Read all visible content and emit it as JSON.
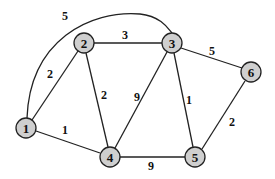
{
  "graph": {
    "type": "weighted-undirected-graph",
    "nodes": [
      {
        "id": "1",
        "label": "1",
        "x": 26,
        "y": 128
      },
      {
        "id": "2",
        "label": "2",
        "x": 84,
        "y": 43
      },
      {
        "id": "3",
        "label": "3",
        "x": 172,
        "y": 43
      },
      {
        "id": "4",
        "label": "4",
        "x": 110,
        "y": 157
      },
      {
        "id": "5",
        "label": "5",
        "x": 195,
        "y": 157
      },
      {
        "id": "6",
        "label": "6",
        "x": 251,
        "y": 72
      }
    ],
    "edges": [
      {
        "from": "1",
        "to": "3",
        "weight": "5"
      },
      {
        "from": "1",
        "to": "2",
        "weight": "2"
      },
      {
        "from": "2",
        "to": "3",
        "weight": "3"
      },
      {
        "from": "3",
        "to": "6",
        "weight": "5"
      },
      {
        "from": "2",
        "to": "4",
        "weight": "2"
      },
      {
        "from": "3",
        "to": "4",
        "weight": "9"
      },
      {
        "from": "3",
        "to": "5",
        "weight": "1"
      },
      {
        "from": "1",
        "to": "4",
        "weight": "1"
      },
      {
        "from": "4",
        "to": "5",
        "weight": "9"
      },
      {
        "from": "5",
        "to": "6",
        "weight": "2"
      }
    ]
  }
}
